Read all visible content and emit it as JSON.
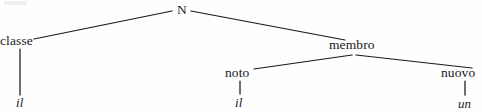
{
  "figure": {
    "kind": "syntax-tree-diagram",
    "background_color": "#fefefe",
    "ink_color": "#19191d",
    "width": 482,
    "height": 112
  },
  "tree": {
    "root": {
      "id": "root-n",
      "label": "N",
      "style": "upright",
      "x": 181,
      "y": 9
    },
    "nodes": [
      {
        "id": "node-classe",
        "label": "classe",
        "style": "upright",
        "x": 22,
        "y": 41,
        "level": 1
      },
      {
        "id": "node-membro",
        "label": "membro",
        "style": "upright",
        "x": 354,
        "y": 45,
        "level": 1
      },
      {
        "id": "node-noto",
        "label": "noto",
        "style": "upright",
        "x": 240,
        "y": 73,
        "level": 2
      },
      {
        "id": "node-nuovo",
        "label": "nuovo",
        "style": "upright",
        "x": 460,
        "y": 73,
        "level": 2
      }
    ],
    "leaves": [
      {
        "id": "leaf-il-classe",
        "label": "il",
        "style": "italic",
        "x": 21,
        "y": 102,
        "parent": "node-classe"
      },
      {
        "id": "leaf-il-noto",
        "label": "il",
        "style": "italic",
        "x": 240,
        "y": 102,
        "parent": "node-noto"
      },
      {
        "id": "leaf-un-nuovo",
        "label": "un",
        "style": "italic",
        "x": 463,
        "y": 103,
        "parent": "node-nuovo"
      }
    ],
    "edges": [
      {
        "id": "edge-n-classe",
        "from": "root-n",
        "to": "node-classe",
        "x1": 172,
        "y1": 11,
        "x2": 34,
        "y2": 39
      },
      {
        "id": "edge-n-membro",
        "from": "root-n",
        "to": "node-membro",
        "x1": 191,
        "y1": 11,
        "x2": 345,
        "y2": 40
      },
      {
        "id": "edge-membro-noto",
        "from": "node-membro",
        "to": "node-noto",
        "x1": 352,
        "y1": 55,
        "x2": 254,
        "y2": 69
      },
      {
        "id": "edge-membro-nuovo",
        "from": "node-membro",
        "to": "node-nuovo",
        "x1": 356,
        "y1": 55,
        "x2": 472,
        "y2": 68
      },
      {
        "id": "edge-classe-il",
        "from": "node-classe",
        "to": "leaf-il-classe",
        "x1": 20,
        "y1": 49,
        "x2": 20,
        "y2": 95
      },
      {
        "id": "edge-noto-il",
        "from": "node-noto",
        "to": "leaf-il-noto",
        "x1": 240,
        "y1": 81,
        "x2": 240,
        "y2": 94
      },
      {
        "id": "edge-nuovo-un",
        "from": "node-nuovo",
        "to": "leaf-un-nuovo",
        "x1": 465,
        "y1": 81,
        "x2": 465,
        "y2": 95
      }
    ]
  }
}
